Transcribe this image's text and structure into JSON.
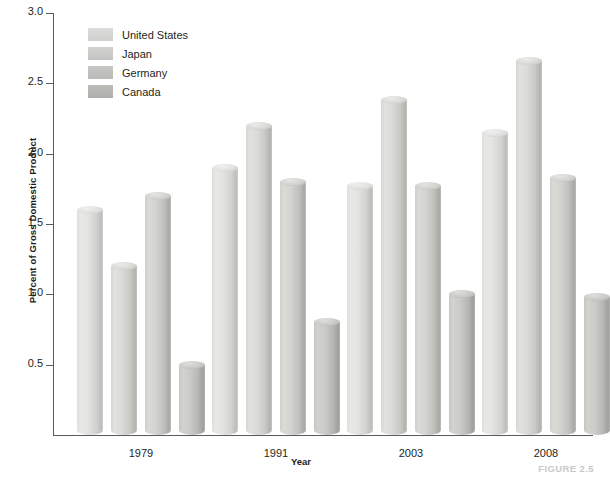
{
  "chart_data": {
    "type": "bar",
    "title": "",
    "subtitle": "",
    "xlabel": "Year",
    "ylabel": "Percent of Gross Domestic Product",
    "categories": [
      "1979",
      "1991",
      "2003",
      "2008"
    ],
    "series": [
      {
        "name": "United States",
        "values": [
          1.6,
          1.9,
          1.77,
          2.15
        ],
        "color": "#e0e0de"
      },
      {
        "name": "Japan",
        "values": [
          1.2,
          2.2,
          2.38,
          2.66
        ],
        "color": "#d8d8d5"
      },
      {
        "name": "Germany",
        "values": [
          1.7,
          1.8,
          1.77,
          1.83
        ],
        "color": "#cdcdca"
      },
      {
        "name": "Canada",
        "values": [
          0.5,
          0.8,
          1.0,
          0.98
        ],
        "color": "#bebebb"
      }
    ],
    "ylim": [
      0,
      3.0
    ],
    "yticks": [
      "0.5",
      "1.0",
      "1.5",
      "2.0",
      "2.5",
      "3.0"
    ],
    "ytick_values": [
      0.5,
      1.0,
      1.5,
      2.0,
      2.5,
      3.0
    ],
    "grid": false,
    "legend_position": "top-left",
    "bar_style": "3d-cylinder"
  },
  "caption": "FIGURE 2.5",
  "legend": {
    "items": [
      {
        "label": "United States"
      },
      {
        "label": "Japan"
      },
      {
        "label": "Germany"
      },
      {
        "label": "Canada"
      }
    ]
  }
}
